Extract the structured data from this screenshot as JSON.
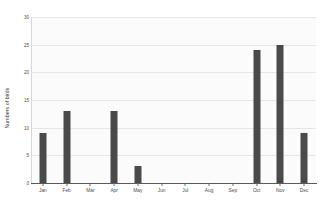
{
  "chart_data": {
    "type": "bar",
    "title": "",
    "xlabel": "",
    "ylabel": "Numbers of birds",
    "categories": [
      "Jan",
      "Feb",
      "Mar",
      "Apr",
      "May",
      "Jun",
      "Jul",
      "Aug",
      "Sep",
      "Oct",
      "Nov",
      "Dec"
    ],
    "values": [
      9,
      13,
      0,
      13,
      3,
      0,
      0,
      0,
      0,
      24,
      25,
      9
    ],
    "ylim": [
      0,
      30
    ],
    "yticks": [
      0,
      5,
      10,
      15,
      20,
      25,
      30
    ],
    "ytick_labels": [
      "0",
      "5",
      "10",
      "15",
      "20",
      "25",
      "30"
    ],
    "grid": true,
    "legend": false,
    "bar_color": "#4a4a4a",
    "plot_background": "#fbfbfb",
    "gridline_color": "#e6e6e6",
    "axis_color": "#5a5a5a"
  }
}
